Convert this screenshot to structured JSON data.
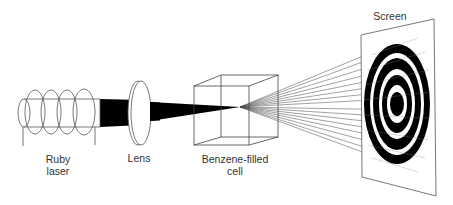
{
  "diagram": {
    "labels": {
      "ruby_laser_line1": "Ruby",
      "ruby_laser_line2": "laser",
      "lens": "Lens",
      "cell_line1": "Benzene-filled",
      "cell_line2": "cell",
      "screen": "Screen"
    },
    "components": [
      {
        "name": "ruby-laser",
        "label": "Ruby laser"
      },
      {
        "name": "lens",
        "label": "Lens"
      },
      {
        "name": "benzene-filled-cell",
        "label": "Benzene-filled cell"
      },
      {
        "name": "screen",
        "label": "Screen"
      }
    ],
    "colors": {
      "line": "#555555",
      "beam": "#000000",
      "background": "#ffffff"
    }
  }
}
